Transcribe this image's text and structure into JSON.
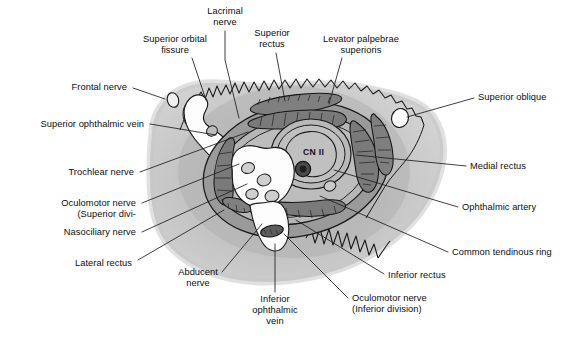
{
  "figure": {
    "canvas": {
      "width": 568,
      "height": 342
    },
    "colors": {
      "background": "#ffffff",
      "orbit_fill_outer": "#c9c9c9",
      "orbit_fill_inner": "#b4b4b4",
      "ring_fill": "#8f8f8f",
      "muscle_fill": "#7d7d7d",
      "lumen_white": "#fdfdfd",
      "vessel_gray": "#b9b9b9",
      "vessel_dark": "#3a3a3a",
      "stroke": "#1a1a1a",
      "leader": "#1d1d1d",
      "text": "#0d0d0d"
    }
  },
  "inline_labels": [
    {
      "name": "optic-nerve",
      "text": "CN II",
      "x": 303,
      "y": 147
    }
  ],
  "labels": [
    {
      "name": "lacrimal-nerve",
      "lines": [
        "Lacrimal",
        "nerve"
      ],
      "align": "center",
      "x": 194,
      "y": 6,
      "w": 62,
      "leader": [
        [
          225,
          31
        ],
        [
          225,
          60
        ],
        [
          239,
          118
        ]
      ]
    },
    {
      "name": "superior-orbital-fissure",
      "lines": [
        "Superior orbital",
        "fissure"
      ],
      "align": "center",
      "x": 127,
      "y": 34,
      "w": 96,
      "leader": [
        [
          192,
          58
        ],
        [
          206,
          100
        ]
      ]
    },
    {
      "name": "superior-rectus",
      "lines": [
        "Superior",
        "rectus"
      ],
      "align": "center",
      "x": 243,
      "y": 28,
      "w": 58,
      "leader": [
        [
          276,
          53
        ],
        [
          285,
          101
        ]
      ]
    },
    {
      "name": "levator-palpebrae-superioris",
      "lines": [
        "Levator palpebrae",
        "superioris"
      ],
      "align": "center",
      "x": 306,
      "y": 34,
      "w": 110,
      "leader": [
        [
          342,
          58
        ],
        [
          329,
          104
        ]
      ]
    },
    {
      "name": "frontal-nerve",
      "lines": [
        "Frontal nerve"
      ],
      "align": "right",
      "x": 44,
      "y": 82,
      "w": 83,
      "leader": [
        [
          133,
          88
        ],
        [
          165,
          99
        ]
      ]
    },
    {
      "name": "superior-oblique",
      "lines": [
        "Superior oblique"
      ],
      "align": "left",
      "x": 478,
      "y": 92,
      "w": 90,
      "leader": [
        [
          474,
          98
        ],
        [
          407,
          117
        ]
      ]
    },
    {
      "name": "superior-ophthalmic-vein",
      "lines": [
        "Superior ophthalmic vein"
      ],
      "align": "right",
      "x": 10,
      "y": 119,
      "w": 134,
      "leader": [
        [
          150,
          124
        ],
        [
          216,
          135
        ]
      ]
    },
    {
      "name": "medial-rectus",
      "lines": [
        "Medial rectus"
      ],
      "align": "left",
      "x": 470,
      "y": 161,
      "w": 80,
      "leader": [
        [
          466,
          166
        ],
        [
          356,
          155
        ]
      ]
    },
    {
      "name": "trochlear-nerve",
      "lines": [
        "Trochlear nerve"
      ],
      "align": "right",
      "x": 42,
      "y": 167,
      "w": 92,
      "leader": [
        [
          140,
          172
        ],
        [
          248,
          132
        ]
      ]
    },
    {
      "name": "ophthalmic-artery",
      "lines": [
        "Ophthalmic artery"
      ],
      "align": "left",
      "x": 462,
      "y": 202,
      "w": 98,
      "leader": [
        [
          458,
          207
        ],
        [
          334,
          170
        ]
      ]
    },
    {
      "name": "oculomotor-nerve-superior-division",
      "lines": [
        "Oculomotor nerve",
        "(Superior divi-"
      ],
      "align": "right",
      "x": 32,
      "y": 198,
      "w": 104,
      "leader": [
        [
          142,
          203
        ],
        [
          239,
          164
        ]
      ]
    },
    {
      "name": "nasociliary-nerve",
      "lines": [
        "Nasociliary nerve"
      ],
      "align": "right",
      "x": 36,
      "y": 227,
      "w": 100,
      "leader": [
        [
          142,
          232
        ],
        [
          247,
          184
        ]
      ]
    },
    {
      "name": "common-tendinous-ring",
      "lines": [
        "Common tendinous ring"
      ],
      "align": "left",
      "x": 452,
      "y": 247,
      "w": 116,
      "leader": [
        [
          448,
          252
        ],
        [
          320,
          196
        ]
      ]
    },
    {
      "name": "lateral-rectus",
      "lines": [
        "Lateral rectus"
      ],
      "align": "right",
      "x": 48,
      "y": 258,
      "w": 84,
      "leader": [
        [
          138,
          260
        ],
        [
          224,
          210
        ]
      ]
    },
    {
      "name": "inferior-rectus",
      "lines": [
        "Inferior rectus"
      ],
      "align": "left",
      "x": 388,
      "y": 270,
      "w": 82,
      "leader": [
        [
          384,
          274
        ],
        [
          296,
          220
        ]
      ]
    },
    {
      "name": "abducent-nerve",
      "lines": [
        "Abducent",
        "nerve"
      ],
      "align": "center",
      "x": 168,
      "y": 267,
      "w": 60,
      "leader": [
        [
          222,
          272
        ],
        [
          262,
          224
        ]
      ]
    },
    {
      "name": "inferior-ophthalmic-vein",
      "lines": [
        "Inferior",
        "ophthalmic",
        "vein"
      ],
      "align": "center",
      "x": 244,
      "y": 294,
      "w": 62,
      "leader": [
        [
          275,
          292
        ],
        [
          275,
          244
        ]
      ]
    },
    {
      "name": "oculomotor-nerve-inferior-division",
      "lines": [
        "Oculomotor nerve",
        "(Inferior division)"
      ],
      "align": "left",
      "x": 352,
      "y": 293,
      "w": 106,
      "leader": [
        [
          348,
          298
        ],
        [
          284,
          234
        ]
      ]
    }
  ]
}
